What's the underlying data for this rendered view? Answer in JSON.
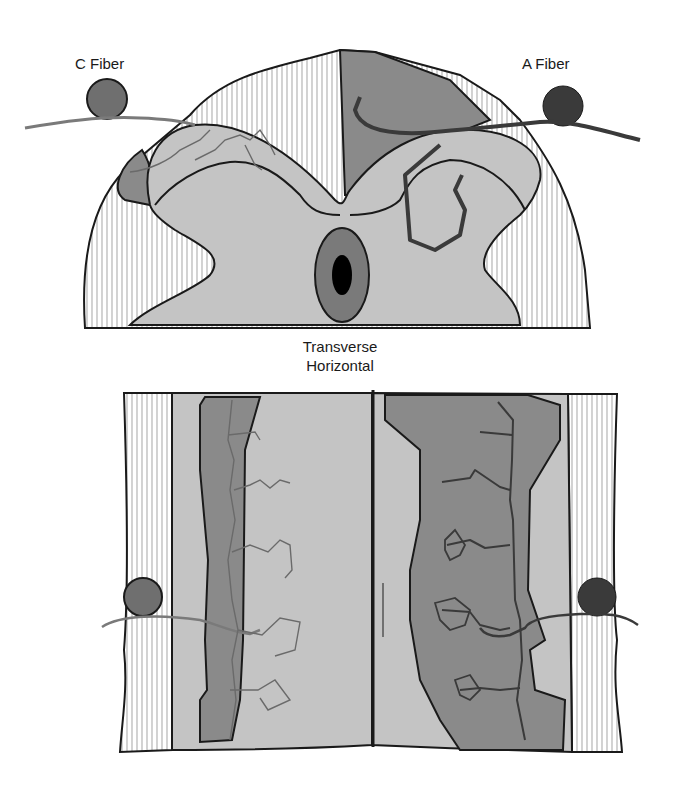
{
  "labels": {
    "c_fiber": "C Fiber",
    "a_fiber": "A Fiber",
    "view_line1": "Transverse",
    "view_line2": "Horizontal"
  },
  "colors": {
    "background": "#ffffff",
    "light_gray": "#c4c4c4",
    "dark_gray": "#8a8a8a",
    "neuron": "#555555",
    "outline": "#1a1a1a",
    "hatch": "#b5b5b5",
    "canal": "#000000"
  },
  "panels": [
    {
      "name": "transverse-section",
      "fibers": [
        "C Fiber",
        "A Fiber"
      ]
    },
    {
      "name": "horizontal-section",
      "fibers": [
        "C Fiber",
        "A Fiber"
      ]
    }
  ]
}
